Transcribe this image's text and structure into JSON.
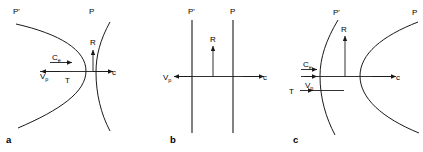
{
  "figure": {
    "background_color": "#ffffff",
    "stroke_color": "#1a1a1a",
    "panels": [
      {
        "letter": "a",
        "surface_left_label": "P'",
        "surface_right_label": "P",
        "labels": {
          "erosion": "C",
          "erosion_sub": "e",
          "velocity": "V",
          "velocity_sub": "p",
          "thickness": "T",
          "retreat": "R",
          "celerity": "c"
        },
        "left_surface_shape": "convex-right-arc",
        "right_surface_shape": "concave-left-arc"
      },
      {
        "letter": "b",
        "surface_left_label": "P'",
        "surface_right_label": "P",
        "labels": {
          "velocity": "V",
          "velocity_sub": "p",
          "retreat": "R",
          "celerity": "c"
        },
        "left_surface_shape": "straight-vertical",
        "right_surface_shape": "straight-vertical"
      },
      {
        "letter": "c",
        "surface_left_label": "P'",
        "surface_right_label": "P",
        "labels": {
          "erosion": "C",
          "erosion_sub": "e",
          "velocity": "V",
          "velocity_sub": "p",
          "thickness": "T",
          "retreat": "R",
          "celerity": "c"
        },
        "left_surface_shape": "gentle-convex-right-arc",
        "right_surface_shape": "strong-convex-left-arc"
      }
    ]
  }
}
